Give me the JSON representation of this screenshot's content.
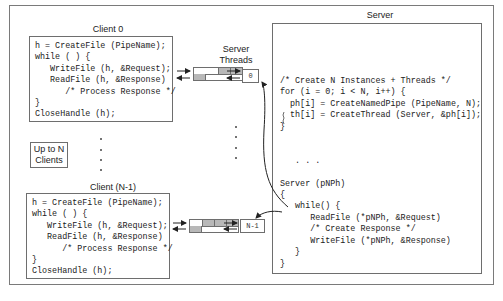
{
  "diagram": {
    "client0": {
      "title": "Client 0",
      "code": [
        "h = CreateFile (PipeName);",
        "while ( ) {",
        "   WriteFile (h, &Request);",
        "   ReadFile (h, &Response)",
        "      /* Process Response */",
        "}",
        "CloseHandle (h);"
      ]
    },
    "clientN1": {
      "title": "Client (N-1)",
      "code": [
        "h = CreateFile (PipeName);",
        "while ( ) {",
        "   WriteFile (h, &Request);",
        "   ReadFile (h, &Response)",
        "      /* Process Response */",
        "}",
        "CloseHandle (h);"
      ]
    },
    "up_to_n_clients": "Up to N\nClients",
    "server_threads_label": "Server\nThreads",
    "thread_boxes": [
      "0",
      "N-1"
    ],
    "server": {
      "title": "Server",
      "code": [
        "/* Create N Instances + Threads */",
        "for (i = 0; i < N, i++) {",
        "  ph[i] = CreateNamedPipe (PipeName, N);",
        "  th[i] = CreateThread (Server, &ph[i]);",
        "}",
        "",
        "",
        "   . . .",
        "",
        "Server (pNPh)",
        "{",
        "   while() {",
        "      ReadFile (*pNPh, &Request)",
        "      /* Create Response */",
        "      WriteFile (*pNPh, &Response)",
        "   }",
        "}"
      ]
    },
    "colors": {
      "border": "#6e6e6e",
      "pipe_fill": "#b8b8b8",
      "text": "#222222"
    }
  }
}
